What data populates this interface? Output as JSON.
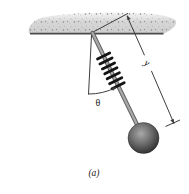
{
  "diagram": {
    "caption": "(a)",
    "angle_label": "θ",
    "length_label": "y",
    "colors": {
      "background": "#ffffff",
      "ceiling_top": "#f5f5f5",
      "ceiling_fill": "#d6d6d6",
      "ceiling_edge": "#4a4a4a",
      "rod_dark": "#606060",
      "rod_light": "#a8a8a8",
      "spring": "#141414",
      "line": "#3d3d3d",
      "text": "#1a1a1a",
      "ball_highlight": "#a9a9a9",
      "ball_mid": "#6d6d6d",
      "ball_dark": "#1f1f1f"
    }
  }
}
